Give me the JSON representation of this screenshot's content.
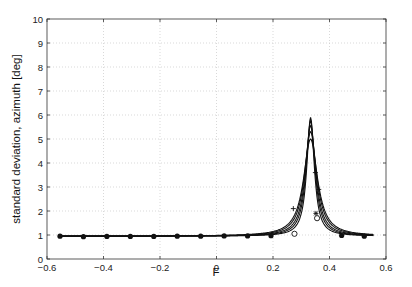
{
  "chart_data": {
    "type": "line",
    "title": "",
    "xlabel": "F",
    "ylabel": "standard deviation, azimuth [deg]",
    "xlim": [
      -0.6,
      0.6
    ],
    "ylim": [
      0,
      10
    ],
    "xticks": [
      -0.6,
      -0.4,
      -0.2,
      0,
      0.2,
      0.4,
      0.6
    ],
    "xtick_labels": [
      "-0.6",
      "-0.4",
      "-0.2",
      "0",
      "0.2",
      "0.4",
      "0.6"
    ],
    "yticks": [
      0,
      1,
      2,
      3,
      4,
      5,
      6,
      7,
      8,
      9,
      10
    ],
    "ytick_labels": [
      "0",
      "1",
      "2",
      "3",
      "4",
      "5",
      "6",
      "7",
      "8",
      "9",
      "10"
    ],
    "grid": true,
    "legend": null,
    "baseline_series": {
      "name": "sample points",
      "marker": "filled-circle",
      "x": [
        -0.554,
        -0.471,
        -0.388,
        -0.305,
        -0.222,
        -0.139,
        -0.056,
        0.027,
        0.11,
        0.193,
        0.443,
        0.523
      ],
      "y": [
        0.95,
        0.93,
        0.94,
        0.94,
        0.94,
        0.95,
        0.95,
        0.96,
        0.96,
        0.97,
        0.98,
        0.95
      ]
    },
    "series": [
      {
        "name": "curve 1",
        "center": 0.333,
        "peak": 5.9,
        "width": 0.016,
        "base": 0.95
      },
      {
        "name": "curve 2",
        "center": 0.333,
        "peak": 5.75,
        "width": 0.019,
        "base": 0.95
      },
      {
        "name": "curve 3",
        "center": 0.333,
        "peak": 5.55,
        "width": 0.022,
        "base": 0.95
      },
      {
        "name": "curve 4",
        "center": 0.333,
        "peak": 5.3,
        "width": 0.026,
        "base": 0.95
      },
      {
        "name": "curve 5",
        "center": 0.333,
        "peak": 5.0,
        "width": 0.03,
        "base": 0.95
      }
    ],
    "peak_markers": [
      {
        "x": 0.276,
        "y": 1.05,
        "marker": "open-circle"
      },
      {
        "x": 0.272,
        "y": 2.1,
        "marker": "plus"
      },
      {
        "x": 0.35,
        "y": 3.6,
        "marker": "plus"
      },
      {
        "x": 0.362,
        "y": 2.9,
        "marker": "plus"
      },
      {
        "x": 0.352,
        "y": 1.9,
        "marker": "star"
      },
      {
        "x": 0.356,
        "y": 1.7,
        "marker": "open-circle"
      }
    ],
    "line_extent": [
      -0.555,
      0.555
    ]
  }
}
